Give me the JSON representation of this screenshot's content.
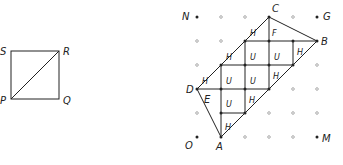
{
  "square": {
    "vertices": {
      "S": [
        11,
        51
      ],
      "R": [
        59,
        51
      ],
      "P": [
        11,
        99
      ],
      "Q": [
        59,
        99
      ]
    },
    "labels": {
      "S": "S",
      "R": "R",
      "P": "P",
      "Q": "Q"
    },
    "diagonal": [
      "P",
      "R"
    ]
  },
  "grid": {
    "cols": [
      197,
      221,
      245,
      269,
      293,
      317
    ],
    "rows": [
      17,
      41,
      65,
      89,
      113,
      137
    ],
    "corner_labels": {
      "N": "N",
      "G": "G",
      "O": "O",
      "M": "M"
    }
  },
  "figure": {
    "labels": {
      "A": "A",
      "B": "B",
      "C": "C",
      "D": "D",
      "E": "E"
    },
    "cells": [
      {
        "t": "H",
        "x": 253,
        "y": 33
      },
      {
        "t": "F",
        "x": 275,
        "y": 33
      },
      {
        "t": "H",
        "x": 229,
        "y": 57
      },
      {
        "t": "U",
        "x": 253,
        "y": 57
      },
      {
        "t": "U",
        "x": 277,
        "y": 57
      },
      {
        "t": "H",
        "x": 300,
        "y": 52
      },
      {
        "t": "H",
        "x": 205,
        "y": 81
      },
      {
        "t": "U",
        "x": 229,
        "y": 81
      },
      {
        "t": "U",
        "x": 253,
        "y": 81
      },
      {
        "t": "H",
        "x": 276,
        "y": 76
      },
      {
        "t": "E",
        "x": 207,
        "y": 100
      },
      {
        "t": "U",
        "x": 229,
        "y": 104
      },
      {
        "t": "H",
        "x": 252,
        "y": 100
      },
      {
        "t": "H",
        "x": 228,
        "y": 127
      }
    ]
  }
}
